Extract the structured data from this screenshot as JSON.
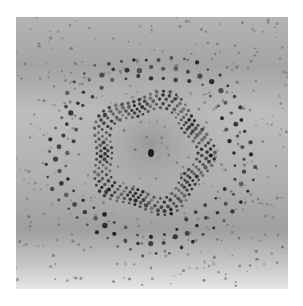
{
  "figure": {
    "colors": {
      "page_background": "#ffffff",
      "film_light": "#c8c8c8",
      "film_mid": "#a9a9a9",
      "film_dark_band": "#9a9a9a",
      "center_haze": "#8f8f8f",
      "spot": "#1e1e1e",
      "faint_spot": "#6e6e6e"
    },
    "frame": {
      "x": 16,
      "y": 17,
      "width": 272,
      "height": 272
    },
    "center": {
      "x": 135,
      "y": 136
    },
    "central_spot": {
      "rx": 3,
      "ry": 4
    },
    "inner_rings": [
      {
        "radius": 43,
        "spots": 46,
        "size": 1.5,
        "petals": 10,
        "petal_amp": 4
      },
      {
        "radius": 47,
        "spots": 50,
        "size": 1.6,
        "petals": 10,
        "petal_amp": 4
      },
      {
        "radius": 51,
        "spots": 54,
        "size": 1.7,
        "petals": 10,
        "petal_amp": 5
      },
      {
        "radius": 55,
        "spots": 58,
        "size": 1.8,
        "petals": 10,
        "petal_amp": 5
      },
      {
        "radius": 59,
        "spots": 60,
        "size": 1.6,
        "petals": 10,
        "petal_amp": 5
      }
    ],
    "outer_rings": [
      {
        "radius": 82,
        "spots": 40,
        "size": 1.8
      },
      {
        "radius": 92,
        "spots": 46,
        "size": 2.1
      },
      {
        "radius": 102,
        "spots": 50,
        "size": 1.7
      }
    ],
    "background_spots": {
      "count": 420,
      "min_size": 0.8,
      "max_size": 1.6,
      "seed": 7
    }
  }
}
